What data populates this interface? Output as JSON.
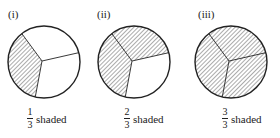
{
  "panels": [
    {
      "label": "(i)",
      "numerator": "1",
      "denominator": "3",
      "caption": "shaded",
      "shaded": [
        true,
        false,
        false
      ]
    },
    {
      "label": "(ii)",
      "numerator": "2",
      "denominator": "3",
      "caption": "shaded",
      "shaded": [
        true,
        true,
        false
      ]
    },
    {
      "label": "(iii)",
      "numerator": "3",
      "denominator": "3",
      "caption": "shaded",
      "shaded": [
        true,
        true,
        true
      ]
    }
  ],
  "colors": {
    "stroke": "#222222",
    "hatch": "#444444"
  }
}
